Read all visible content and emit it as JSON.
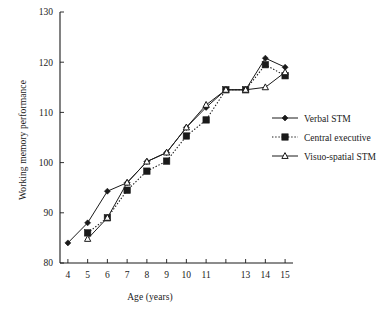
{
  "chart_data": {
    "type": "line",
    "title": "",
    "xlabel": "Age (years)",
    "ylabel": "Working memory performance",
    "x": [
      4,
      5,
      6,
      7,
      8,
      9,
      10,
      11,
      12,
      13,
      14,
      15
    ],
    "xtick_labels": [
      "4",
      "5",
      "6",
      "7",
      "8",
      "9",
      "10",
      "11",
      "",
      "13",
      "14",
      "15"
    ],
    "xlim": [
      3.6,
      15.4
    ],
    "ylim": [
      80,
      130
    ],
    "ytick_labels": [
      "80",
      "90",
      "100",
      "110",
      "120",
      "130"
    ],
    "yticks": [
      80,
      90,
      100,
      110,
      120,
      130
    ],
    "grid": false,
    "legend_position": "right",
    "series": [
      {
        "name": "Verbal STM",
        "marker": "filled-diamond",
        "line": "solid",
        "color": "#1a1a1a",
        "x": [
          4,
          5,
          6,
          7,
          8,
          9,
          10,
          11,
          12,
          13,
          14,
          15
        ],
        "values": [
          84.0,
          88.0,
          94.3,
          96.0,
          100.2,
          102.0,
          107.0,
          111.0,
          114.5,
          114.5,
          120.8,
          119.0
        ]
      },
      {
        "name": "Central executive",
        "marker": "filled-square",
        "line": "dotted",
        "color": "#1a1a1a",
        "x": [
          5,
          6,
          7,
          8,
          9,
          10,
          11,
          12,
          13,
          14,
          15
        ],
        "values": [
          86.0,
          89.0,
          94.5,
          98.3,
          100.3,
          105.3,
          108.5,
          114.5,
          114.5,
          119.5,
          117.3
        ]
      },
      {
        "name": "Visuo-spatial STM",
        "marker": "open-triangle",
        "line": "solid",
        "color": "#1a1a1a",
        "x": [
          5,
          6,
          7,
          8,
          9,
          10,
          11,
          12,
          13,
          14,
          15
        ],
        "values": [
          84.8,
          89.0,
          96.0,
          100.2,
          102.0,
          107.0,
          111.5,
          114.5,
          114.5,
          115.0,
          118.0
        ]
      }
    ]
  },
  "legend": {
    "items": [
      {
        "label": "Verbal STM",
        "marker": "filled-diamond",
        "line": "solid"
      },
      {
        "label": "Central executive",
        "marker": "filled-square",
        "line": "dotted"
      },
      {
        "label": "Visuo-spatial STM",
        "marker": "open-triangle",
        "line": "solid"
      }
    ]
  }
}
